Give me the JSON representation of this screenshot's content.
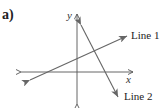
{
  "figure": {
    "part_label": "a)",
    "axes": {
      "x_label": "x",
      "y_label": "y"
    },
    "lines": [
      {
        "name": "line-1",
        "label": "Line 1",
        "color": "#666666"
      },
      {
        "name": "line-2",
        "label": "Line 2",
        "color": "#666666"
      }
    ],
    "colors": {
      "axis": "#555555",
      "text": "#222222"
    }
  }
}
